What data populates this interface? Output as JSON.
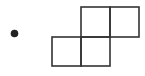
{
  "diagram": {
    "type": "polyomino",
    "stroke_color": "#333333",
    "bullet_color": "#222222",
    "background": "#ffffff",
    "bullet": {
      "cx": 14.5,
      "cy": 33.5,
      "r": 3.8
    },
    "cell_size": 29,
    "cells": [
      {
        "row": 0,
        "col": 1,
        "x": 81,
        "y": 7
      },
      {
        "row": 0,
        "col": 2,
        "x": 110,
        "y": 7
      },
      {
        "row": 1,
        "col": 0,
        "x": 52,
        "y": 37
      },
      {
        "row": 1,
        "col": 1,
        "x": 81,
        "y": 37
      }
    ]
  }
}
